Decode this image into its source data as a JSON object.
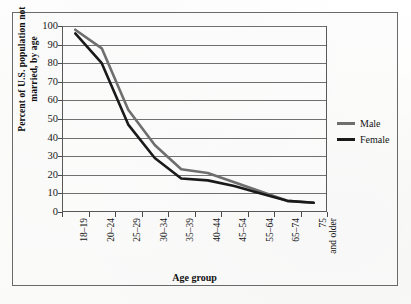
{
  "chart_data": {
    "type": "line",
    "title": "",
    "xlabel": "Age group",
    "ylabel_line1": "Percent of  U.S. population not",
    "ylabel_line2": "married, by age",
    "categories": [
      "18–19",
      "20–24",
      "25–29",
      "30–34",
      "35–39",
      "40–44",
      "45–54",
      "55–64",
      "65–74",
      "75 and older"
    ],
    "categories_display": [
      {
        "line1": "18–19",
        "line2": ""
      },
      {
        "line1": "20–24",
        "line2": ""
      },
      {
        "line1": "25–29",
        "line2": ""
      },
      {
        "line1": "30–34",
        "line2": ""
      },
      {
        "line1": "35–39",
        "line2": ""
      },
      {
        "line1": "40–44",
        "line2": ""
      },
      {
        "line1": "45–54",
        "line2": ""
      },
      {
        "line1": "55–64",
        "line2": ""
      },
      {
        "line1": "65–74",
        "line2": ""
      },
      {
        "line1": "75",
        "line2": "and older"
      }
    ],
    "series": [
      {
        "name": "Male",
        "color": "#6e6e6e",
        "values": [
          98,
          88,
          55,
          36,
          23,
          21,
          16,
          11,
          6,
          5
        ]
      },
      {
        "name": "Female",
        "color": "#1a1a1a",
        "values": [
          96,
          80,
          47,
          29,
          18,
          17,
          14,
          10,
          6,
          5
        ]
      }
    ],
    "ylim": [
      0,
      100
    ],
    "ytick_step": 10,
    "yticks": [
      "0",
      "10",
      "20",
      "30",
      "40",
      "50",
      "60",
      "70",
      "80",
      "90",
      "100"
    ],
    "grid": true,
    "legend_position": "right"
  },
  "legend": {
    "entries": [
      {
        "label": "Male",
        "color": "#6e6e6e"
      },
      {
        "label": "Female",
        "color": "#1a1a1a"
      }
    ]
  }
}
